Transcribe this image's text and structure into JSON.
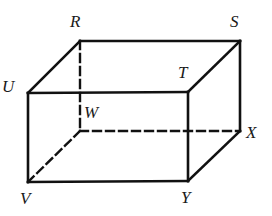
{
  "figure": {
    "kind": "rectangular-prism",
    "stroke_color": "#111111",
    "background_color": "#ffffff",
    "stroke_width": 2.6,
    "hidden_stroke_width": 2.4,
    "dash_pattern": "8 5",
    "vertices": [
      {
        "id": "R",
        "label": "R",
        "x": 80,
        "y": 41,
        "hidden": false,
        "label_x": 70,
        "label_y": 13
      },
      {
        "id": "S",
        "label": "S",
        "x": 240,
        "y": 41,
        "hidden": false,
        "label_x": 230,
        "label_y": 13
      },
      {
        "id": "U",
        "label": "U",
        "x": 28,
        "y": 93,
        "hidden": false,
        "label_x": 2,
        "label_y": 78
      },
      {
        "id": "T",
        "label": "T",
        "x": 188,
        "y": 92,
        "hidden": false,
        "label_x": 178,
        "label_y": 64
      },
      {
        "id": "W",
        "label": "W",
        "x": 80,
        "y": 131,
        "hidden": true,
        "label_x": 84,
        "label_y": 104
      },
      {
        "id": "X",
        "label": "X",
        "x": 240,
        "y": 131,
        "hidden": false,
        "label_x": 246,
        "label_y": 124
      },
      {
        "id": "V",
        "label": "V",
        "x": 28,
        "y": 182,
        "hidden": false,
        "label_x": 20,
        "label_y": 190
      },
      {
        "id": "Y",
        "label": "Y",
        "x": 188,
        "y": 181,
        "hidden": false,
        "label_x": 181,
        "label_y": 189
      }
    ],
    "edges": [
      {
        "id": "RS",
        "from": "R",
        "to": "S",
        "style": "solid",
        "face": "top"
      },
      {
        "id": "UR",
        "from": "U",
        "to": "R",
        "style": "solid",
        "face": "top"
      },
      {
        "id": "UT",
        "from": "U",
        "to": "T",
        "style": "solid",
        "face": "top"
      },
      {
        "id": "TS",
        "from": "T",
        "to": "S",
        "style": "solid",
        "face": "top"
      },
      {
        "id": "UV",
        "from": "U",
        "to": "V",
        "style": "solid",
        "face": "front"
      },
      {
        "id": "VY",
        "from": "V",
        "to": "Y",
        "style": "solid",
        "face": "front"
      },
      {
        "id": "YT",
        "from": "Y",
        "to": "T",
        "style": "solid",
        "face": "front"
      },
      {
        "id": "YX",
        "from": "Y",
        "to": "X",
        "style": "solid",
        "face": "right"
      },
      {
        "id": "XS",
        "from": "X",
        "to": "S",
        "style": "solid",
        "face": "right"
      },
      {
        "id": "RW",
        "from": "R",
        "to": "W",
        "style": "dashed",
        "face": "hidden"
      },
      {
        "id": "WX",
        "from": "W",
        "to": "X",
        "style": "dashed",
        "face": "hidden"
      },
      {
        "id": "WV",
        "from": "W",
        "to": "V",
        "style": "dashed",
        "face": "hidden"
      }
    ]
  }
}
